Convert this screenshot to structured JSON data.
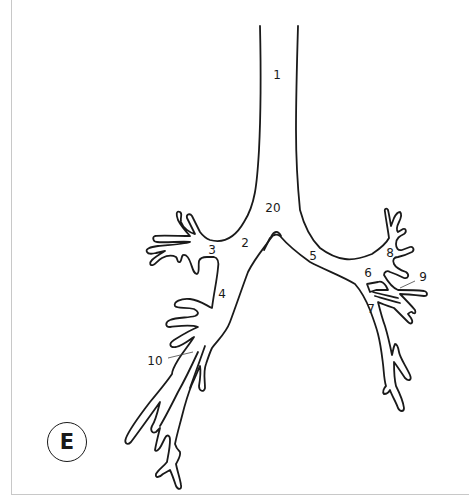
{
  "panel": {
    "letter": "E"
  },
  "labels": [
    {
      "id": "1",
      "text": "1",
      "x": 277,
      "y": 75
    },
    {
      "id": "20",
      "text": "20",
      "x": 273,
      "y": 208
    },
    {
      "id": "2",
      "text": "2",
      "x": 245,
      "y": 243
    },
    {
      "id": "3",
      "text": "3",
      "x": 212,
      "y": 250
    },
    {
      "id": "4",
      "text": "4",
      "x": 222,
      "y": 294
    },
    {
      "id": "5",
      "text": "5",
      "x": 313,
      "y": 256
    },
    {
      "id": "6",
      "text": "6",
      "x": 368,
      "y": 273
    },
    {
      "id": "7",
      "text": "7",
      "x": 371,
      "y": 309
    },
    {
      "id": "8",
      "text": "8",
      "x": 390,
      "y": 253
    },
    {
      "id": "9",
      "text": "9",
      "x": 423,
      "y": 277
    },
    {
      "id": "10",
      "text": "10",
      "x": 155,
      "y": 361
    }
  ],
  "colors": {
    "line": "#1a1a1a",
    "frame": "#c8c8c8",
    "background": "#ffffff"
  }
}
